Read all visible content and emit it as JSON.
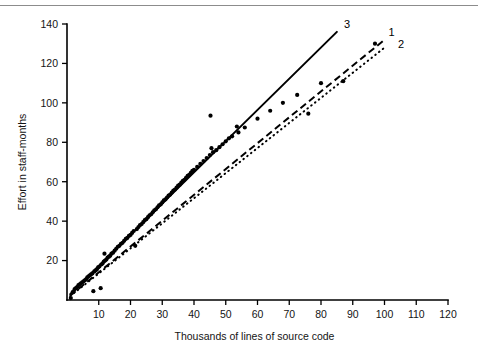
{
  "figure": {
    "name": "effort-vs-source-size-scatter",
    "background": "#ffffff",
    "ink": "#000000",
    "rule_color": "#8c8c8c"
  },
  "chart_data": {
    "type": "scatter",
    "title": "",
    "xlabel": "Thousands of lines of source code",
    "ylabel": "Effort in staff-months",
    "xlim": [
      0,
      120
    ],
    "ylim": [
      0,
      140
    ],
    "xticks": [
      0,
      10,
      20,
      30,
      40,
      50,
      60,
      70,
      80,
      90,
      100,
      110,
      120
    ],
    "xticklabels": [
      "",
      "10",
      "20",
      "30",
      "40",
      "50",
      "60",
      "70",
      "80",
      "90",
      "100",
      "110",
      "120"
    ],
    "yticks": [
      0,
      20,
      40,
      60,
      80,
      100,
      120,
      140
    ],
    "yticklabels": [
      "",
      "20",
      "40",
      "60",
      "80",
      "100",
      "120",
      "140"
    ],
    "grid": false,
    "legend": "inline-curve-labels",
    "points": [
      [
        1.2,
        1.0
      ],
      [
        1.8,
        4.0
      ],
      [
        2.4,
        5.5
      ],
      [
        2.8,
        6.0
      ],
      [
        3.2,
        6.5
      ],
      [
        3.6,
        7.5
      ],
      [
        4.0,
        8.0
      ],
      [
        4.4,
        8.5
      ],
      [
        4.8,
        9.0
      ],
      [
        5.2,
        9.5
      ],
      [
        5.6,
        10.0
      ],
      [
        6.0,
        10.5
      ],
      [
        6.4,
        11.5
      ],
      [
        6.8,
        12.0
      ],
      [
        7.2,
        12.5
      ],
      [
        7.6,
        13.0
      ],
      [
        8.0,
        13.5
      ],
      [
        8.3,
        4.5
      ],
      [
        8.6,
        14.5
      ],
      [
        9.0,
        15.0
      ],
      [
        9.4,
        15.5
      ],
      [
        9.8,
        16.5
      ],
      [
        10.2,
        17.0
      ],
      [
        10.6,
        6.0
      ],
      [
        10.8,
        18.0
      ],
      [
        11.2,
        18.5
      ],
      [
        11.6,
        19.5
      ],
      [
        11.8,
        23.5
      ],
      [
        12.0,
        20.0
      ],
      [
        12.4,
        20.5
      ],
      [
        12.8,
        21.5
      ],
      [
        13.2,
        22.0
      ],
      [
        13.6,
        22.5
      ],
      [
        14.0,
        23.5
      ],
      [
        14.5,
        24.0
      ],
      [
        15.0,
        25.0
      ],
      [
        15.5,
        26.0
      ],
      [
        16.0,
        27.0
      ],
      [
        16.5,
        27.5
      ],
      [
        17.0,
        28.5
      ],
      [
        17.5,
        29.0
      ],
      [
        18.0,
        30.0
      ],
      [
        18.5,
        31.0
      ],
      [
        19.0,
        31.5
      ],
      [
        19.5,
        32.5
      ],
      [
        20.0,
        33.0
      ],
      [
        20.5,
        34.0
      ],
      [
        21.0,
        35.0
      ],
      [
        21.5,
        27.5
      ],
      [
        22.0,
        36.0
      ],
      [
        22.5,
        37.0
      ],
      [
        23.0,
        38.0
      ],
      [
        23.5,
        38.5
      ],
      [
        24.0,
        39.5
      ],
      [
        24.5,
        40.5
      ],
      [
        25.0,
        41.0
      ],
      [
        25.5,
        42.0
      ],
      [
        26.0,
        43.0
      ],
      [
        26.5,
        43.5
      ],
      [
        27.0,
        44.5
      ],
      [
        27.5,
        45.5
      ],
      [
        28.0,
        46.0
      ],
      [
        28.5,
        47.0
      ],
      [
        29.0,
        48.0
      ],
      [
        29.5,
        48.5
      ],
      [
        30.0,
        49.5
      ],
      [
        30.5,
        50.5
      ],
      [
        31.0,
        51.0
      ],
      [
        31.5,
        52.0
      ],
      [
        32.0,
        53.0
      ],
      [
        32.5,
        53.5
      ],
      [
        33.0,
        54.5
      ],
      [
        33.5,
        55.5
      ],
      [
        34.0,
        56.0
      ],
      [
        34.5,
        57.0
      ],
      [
        35.0,
        58.0
      ],
      [
        35.5,
        58.5
      ],
      [
        36.0,
        59.5
      ],
      [
        36.5,
        60.5
      ],
      [
        37.0,
        61.0
      ],
      [
        37.5,
        62.0
      ],
      [
        38.0,
        63.0
      ],
      [
        38.5,
        63.5
      ],
      [
        39.0,
        64.5
      ],
      [
        39.5,
        65.5
      ],
      [
        40.0,
        66.0
      ],
      [
        41.0,
        67.5
      ],
      [
        42.0,
        69.0
      ],
      [
        43.0,
        70.5
      ],
      [
        44.0,
        72.0
      ],
      [
        45.0,
        73.5
      ],
      [
        45.2,
        93.5
      ],
      [
        45.5,
        77.0
      ],
      [
        46.0,
        75.0
      ],
      [
        47.0,
        76.0
      ],
      [
        48.0,
        77.5
      ],
      [
        49.0,
        79.0
      ],
      [
        50.0,
        80.5
      ],
      [
        51.0,
        82.0
      ],
      [
        52.0,
        83.0
      ],
      [
        53.5,
        88.0
      ],
      [
        54.0,
        85.0
      ],
      [
        56.0,
        87.5
      ],
      [
        60.0,
        92.0
      ],
      [
        64.0,
        96.0
      ],
      [
        68.0,
        100.0
      ],
      [
        72.5,
        104.0
      ],
      [
        76.0,
        94.5
      ],
      [
        80.0,
        110.0
      ],
      [
        87.0,
        111.0
      ],
      [
        97.0,
        130.0
      ]
    ],
    "series": [
      {
        "name": "1",
        "label": "1",
        "style": "dashed",
        "x": [
          1,
          100
        ],
        "y": [
          2.2,
          132.0
        ],
        "label_xy": [
          100,
          136
        ]
      },
      {
        "name": "2",
        "label": "2",
        "style": "dotted",
        "x": [
          1,
          100
        ],
        "y": [
          2.0,
          128.0
        ],
        "label_xy": [
          103,
          130
        ]
      },
      {
        "name": "3",
        "label": "3",
        "style": "solid",
        "x": [
          1,
          85
        ],
        "y": [
          3.0,
          136.0
        ],
        "label_xy": [
          86,
          140
        ]
      }
    ]
  },
  "axes": {
    "x_title": "Thousands of lines of source code",
    "y_title": "Effort in staff-months"
  }
}
